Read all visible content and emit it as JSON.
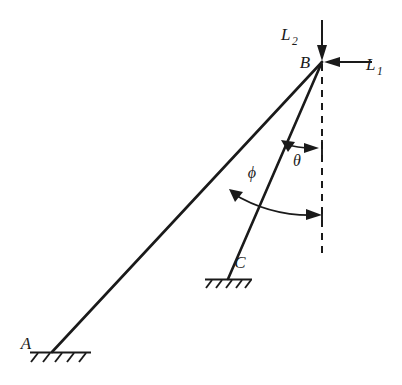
{
  "diagram": {
    "background_color": "#ffffff",
    "ink_color": "#1a1a1a",
    "joints": [
      {
        "id": "A",
        "label": "A",
        "x": 52,
        "y": 352,
        "support": "ground-hatched"
      },
      {
        "id": "B",
        "label": "B",
        "x": 322,
        "y": 62,
        "support": "free-loaded-node"
      },
      {
        "id": "C",
        "label": "C",
        "x": 228,
        "y": 279,
        "support": "ground-hatched"
      }
    ],
    "members": [
      {
        "id": "AB",
        "from": "A",
        "to": "B"
      },
      {
        "id": "CB",
        "from": "C",
        "to": "B"
      }
    ],
    "loads": [
      {
        "id": "L2",
        "label": "L",
        "subscript": "2",
        "direction": "downward-vertical",
        "applied_at": "B",
        "label_x": 288,
        "label_y": 40
      },
      {
        "id": "L1",
        "label": "L",
        "subscript": "1",
        "direction": "leftward-horizontal",
        "applied_at": "B",
        "label_x": 371,
        "label_y": 70
      }
    ],
    "reference_line": {
      "id": "vertical-datum",
      "style": "dashed",
      "from_x": 322,
      "from_y": 62,
      "to_x": 322,
      "to_y": 256
    },
    "angles": [
      {
        "id": "phi",
        "label": "ϕ",
        "measured_from": "member-AB",
        "measured_to": "vertical-datum",
        "label_x": 252,
        "label_y": 178
      },
      {
        "id": "theta",
        "label": "θ",
        "measured_from": "member-CB",
        "measured_to": "vertical-datum",
        "label_x": 297,
        "label_y": 166
      }
    ]
  }
}
